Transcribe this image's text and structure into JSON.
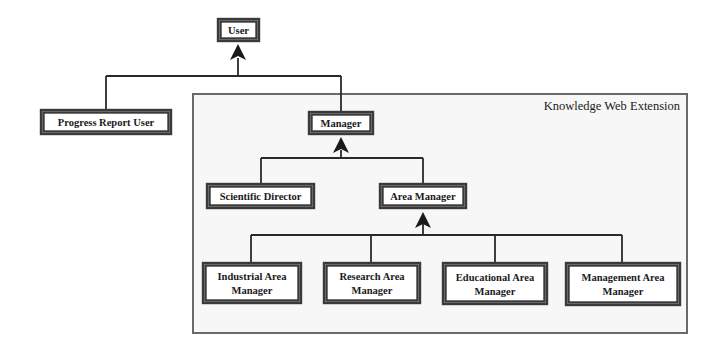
{
  "diagram": {
    "type": "class-hierarchy",
    "container": {
      "label": "Knowledge Web Extension"
    },
    "nodes": {
      "user": {
        "lines": [
          "User"
        ]
      },
      "progress_report_user": {
        "lines": [
          "Progress Report User"
        ]
      },
      "manager": {
        "lines": [
          "Manager"
        ]
      },
      "scientific_director": {
        "lines": [
          "Scientific Director"
        ]
      },
      "area_manager": {
        "lines": [
          "Area Manager"
        ]
      },
      "industrial_area_manager": {
        "lines": [
          "Industrial Area",
          "Manager"
        ]
      },
      "research_area_manager": {
        "lines": [
          "Research Area",
          "Manager"
        ]
      },
      "educational_area_manager": {
        "lines": [
          "Educational Area",
          "Manager"
        ]
      },
      "management_area_manager": {
        "lines": [
          "Management Area",
          "Manager"
        ]
      }
    },
    "edges": [
      {
        "parent": "user",
        "children": [
          "progress_report_user",
          "manager"
        ],
        "relation": "inherits"
      },
      {
        "parent": "manager",
        "children": [
          "scientific_director",
          "area_manager"
        ],
        "relation": "inherits"
      },
      {
        "parent": "area_manager",
        "children": [
          "industrial_area_manager",
          "research_area_manager",
          "educational_area_manager",
          "management_area_manager"
        ],
        "relation": "inherits"
      }
    ]
  }
}
